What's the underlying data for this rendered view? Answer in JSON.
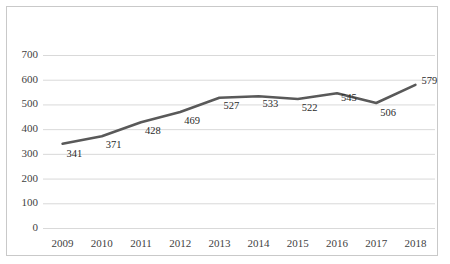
{
  "chart_data": {
    "type": "line",
    "title": "",
    "subtitle": "",
    "xlabel": "",
    "ylabel": "",
    "categories": [
      "2009",
      "2010",
      "2011",
      "2012",
      "2013",
      "2014",
      "2015",
      "2016",
      "2017",
      "2018"
    ],
    "values": [
      341,
      371,
      428,
      469,
      527,
      533,
      522,
      545,
      506,
      579
    ],
    "data_labels": [
      "341",
      "371",
      "428",
      "469",
      "527",
      "533",
      "522",
      "545",
      "506",
      "579"
    ],
    "ylim": [
      0,
      700
    ],
    "ytick_labels": [
      "700",
      "600",
      "500",
      "400",
      "300",
      "200",
      "100",
      "0"
    ],
    "ytick_values": [
      700,
      600,
      500,
      400,
      300,
      200,
      100,
      0
    ],
    "ystep": 100,
    "grid": {
      "horizontal": true,
      "vertical": false,
      "color": "#d9d9d9"
    },
    "legend": {
      "visible": false,
      "position": "none",
      "entries": []
    },
    "series": [
      {
        "name": "Series 1",
        "color": "#595959",
        "line_width": 2.6,
        "markers": false,
        "values": [
          341,
          371,
          428,
          469,
          527,
          533,
          522,
          545,
          506,
          579
        ]
      }
    ],
    "colors": {
      "line": "#595959",
      "gridline": "#d9d9d9",
      "axis_text": "#3f3f3f",
      "data_label": "#2b2b2b",
      "plot_background": "#ffffff",
      "border": "#c9c9c9"
    },
    "annotations": []
  }
}
